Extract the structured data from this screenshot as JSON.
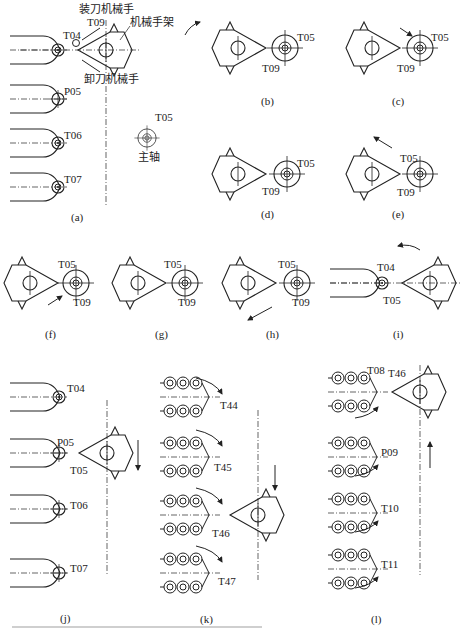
{
  "figure": {
    "panels": [
      {
        "id": "a",
        "caption": "(a)",
        "labels": {
          "loader": "装刀机械手",
          "arm": "机械手架",
          "unloader": "卸刀机械手",
          "spindle": "主轴",
          "t04": "T04",
          "t09": "T09",
          "p05": "P05",
          "t06": "T06",
          "t07": "T07",
          "t05": "T05"
        }
      },
      {
        "id": "b",
        "caption": "(b)",
        "labels": {
          "t05": "T05",
          "t09": "T09"
        }
      },
      {
        "id": "c",
        "caption": "(c)",
        "labels": {
          "t05": "T05",
          "t09": "T09"
        }
      },
      {
        "id": "d",
        "caption": "(d)",
        "labels": {
          "t05": "T05",
          "t09": "T09"
        }
      },
      {
        "id": "e",
        "caption": "(e)",
        "labels": {
          "t05": "T05",
          "t09": "T09"
        }
      },
      {
        "id": "f",
        "caption": "(f)",
        "labels": {
          "t05": "T05",
          "t09": "T09"
        }
      },
      {
        "id": "g",
        "caption": "(g)",
        "labels": {
          "t05": "T05",
          "t09": "T09"
        }
      },
      {
        "id": "h",
        "caption": "(h)",
        "labels": {
          "t05": "T05",
          "t09": "T09"
        }
      },
      {
        "id": "i",
        "caption": "(i)",
        "labels": {
          "t04": "T04",
          "t05": "T05"
        }
      },
      {
        "id": "j",
        "caption": "(j)",
        "labels": {
          "t04": "T04",
          "p05": "P05",
          "t05": "T05",
          "t06": "T06",
          "t07": "T07"
        }
      },
      {
        "id": "k",
        "caption": "(k)",
        "labels": {
          "t44": "T44",
          "t45": "T45",
          "t46": "T46",
          "t47": "T47"
        }
      },
      {
        "id": "l",
        "caption": "(l)",
        "labels": {
          "t08": "T08",
          "t46": "T46",
          "p09": "P09",
          "t10": "T10",
          "t11": "T11"
        }
      }
    ]
  }
}
